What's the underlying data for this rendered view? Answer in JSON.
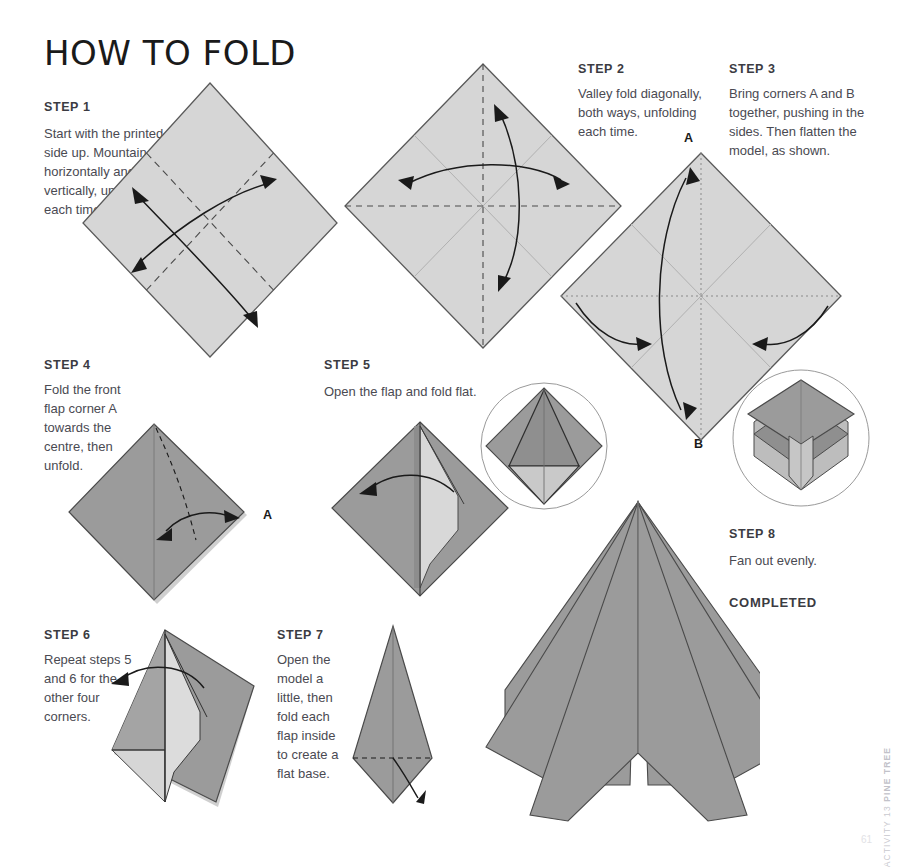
{
  "page": {
    "title": "HOW TO FOLD",
    "side_note_activity": "ACTIVITY 13",
    "side_note_model": "PINE TREE",
    "folio": "61"
  },
  "steps": [
    {
      "id": "step-1",
      "head": "STEP 1",
      "body": "Start with the printed side up. Mountain fold horizontally and vertically, unfolding each time."
    },
    {
      "id": "step-2",
      "head": "STEP 2",
      "body": "Valley fold diagonally, both ways, unfolding each time."
    },
    {
      "id": "step-3",
      "head": "STEP 3",
      "body": "Bring corners A and B together, pushing in the sides. Then flatten the model, as shown."
    },
    {
      "id": "step-4",
      "head": "STEP 4",
      "body": "Fold the front flap corner A towards the centre, then unfold."
    },
    {
      "id": "step-5",
      "head": "STEP 5",
      "body": "Open the flap and fold flat."
    },
    {
      "id": "step-6",
      "head": "STEP 6",
      "body": "Repeat steps 5 and 6 for the other four corners."
    },
    {
      "id": "step-7",
      "head": "STEP 7",
      "body": "Open the model a little, then fold each flap inside to create a flat base."
    },
    {
      "id": "step-8",
      "head": "STEP 8",
      "body": "Fan out evenly."
    }
  ],
  "labels": {
    "completed": "COMPLETED",
    "corner_a_step3": "A",
    "corner_b_step3": "B",
    "corner_a_step4": "A"
  },
  "colors": {
    "paper_light": "#d6d6d6",
    "paper_mid": "#9b9b9b",
    "paper_dark": "#8f8f8f",
    "paper_pale": "#dcdcdc",
    "outline": "#4a4a4a",
    "fold_line": "#b4b4b4",
    "arrow": "#1a1a1a",
    "text": "#4a4a52",
    "heading": "#3b3b42"
  }
}
